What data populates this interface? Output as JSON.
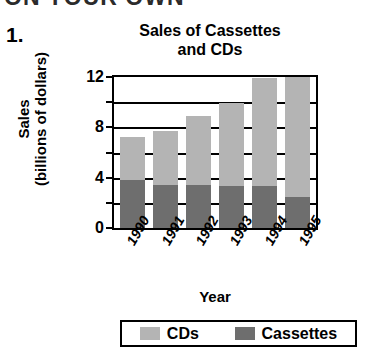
{
  "page": {
    "cut_off_header": "ON YOUR OWN",
    "problem_number": "1.",
    "x_axis_title": "Year"
  },
  "chart_data": {
    "type": "bar",
    "subtype": "stacked",
    "title": "Sales of Cassettes and CDs",
    "title_line1": "Sales of Cassettes",
    "title_line2": "and CDs",
    "xlabel": "Year",
    "ylabel": "Sales (billions of dollars)",
    "ylabel_line1": "Sales",
    "ylabel_line2": "(billions of dollars)",
    "categories": [
      "1990",
      "1991",
      "1992",
      "1993",
      "1994",
      "1995"
    ],
    "series": [
      {
        "name": "Cassettes",
        "color": "#6e6e6e",
        "values": [
          3.8,
          3.4,
          3.4,
          3.3,
          3.3,
          2.5
        ]
      },
      {
        "name": "CDs",
        "color": "#b4b4b4",
        "values": [
          3.4,
          4.3,
          5.5,
          6.6,
          8.6,
          9.5
        ]
      }
    ],
    "totals": [
      7.2,
      7.7,
      8.9,
      9.9,
      11.9,
      12.0
    ],
    "ylim": [
      0,
      12
    ],
    "yticks": [
      0,
      4,
      8,
      12
    ],
    "ytick_labels": [
      "0",
      "4",
      "8",
      "12"
    ],
    "gridlines": [
      0,
      2,
      4,
      6,
      8,
      10,
      12
    ],
    "grid": true,
    "legend_position": "bottom",
    "legend": [
      {
        "label": "CDs",
        "color": "#b4b4b4"
      },
      {
        "label": "Cassettes",
        "color": "#6e6e6e"
      }
    ]
  }
}
